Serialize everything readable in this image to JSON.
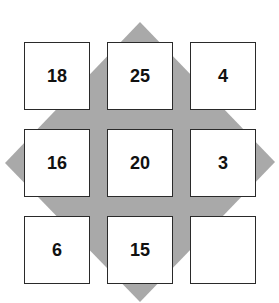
{
  "diagram": {
    "type": "magic-square-puzzle",
    "background_shape": {
      "shape": "diamond",
      "color": "#a9a9a9"
    },
    "grid": [
      [
        {
          "value": "18"
        },
        {
          "value": "25"
        },
        {
          "value": "4"
        }
      ],
      [
        {
          "value": "16"
        },
        {
          "value": "20"
        },
        {
          "value": "3"
        }
      ],
      [
        {
          "value": "6"
        },
        {
          "value": "15"
        },
        {
          "value": ""
        }
      ]
    ]
  }
}
